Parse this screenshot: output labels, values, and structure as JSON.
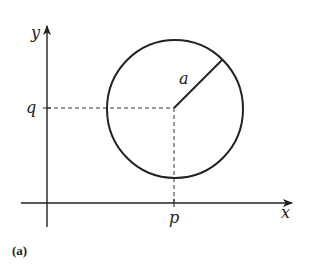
{
  "figure": {
    "panel_label": "(a)",
    "axes": {
      "x_label": "x",
      "y_label": "y"
    },
    "circle": {
      "center_x_label": "p",
      "center_y_label": "q",
      "radius_label": "a"
    },
    "colors": {
      "ink": "#222222",
      "background": "#ffffff"
    }
  }
}
